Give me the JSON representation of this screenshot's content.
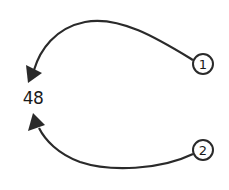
{
  "diagram": {
    "center_value": "48",
    "nodes": [
      {
        "id": "1",
        "label": "1"
      },
      {
        "id": "2",
        "label": "2"
      }
    ],
    "edges": [
      {
        "from": "1",
        "to": "48",
        "style": "curved-arrow-over-top"
      },
      {
        "from": "2",
        "to": "48",
        "style": "curved-arrow-under-bottom"
      }
    ],
    "colors": {
      "stroke": "#2a2a2a",
      "background": "#ffffff"
    }
  }
}
